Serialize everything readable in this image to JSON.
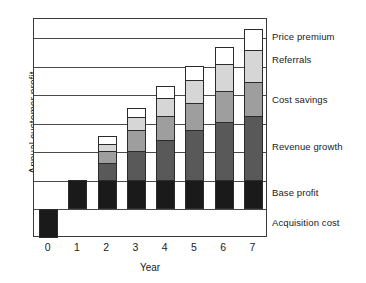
{
  "chart_data": {
    "type": "bar",
    "subtype": "stacked-bar",
    "title": "",
    "xlabel": "Year",
    "ylabel": "Annual customer profit",
    "categories": [
      "0",
      "1",
      "2",
      "3",
      "4",
      "5",
      "6",
      "7"
    ],
    "grid": true,
    "legend_position": "right-inline",
    "ylim": [
      -1.2,
      8.0
    ],
    "yticks_labeled": false,
    "gridline_values": [
      1.2,
      2.4,
      3.6,
      4.8,
      6.0,
      7.2
    ],
    "series": [
      {
        "name": "Acquisition cost",
        "color": "#1a1a1a",
        "sign": "negative",
        "values": [
          -1.2,
          0,
          0,
          0,
          0,
          0,
          0,
          0
        ]
      },
      {
        "name": "Base profit",
        "color": "#1a1a1a",
        "values": [
          0,
          1.2,
          1.2,
          1.2,
          1.2,
          1.2,
          1.2,
          1.2
        ]
      },
      {
        "name": "Revenue growth",
        "color": "#595959",
        "values": [
          0,
          0,
          0.75,
          1.25,
          1.7,
          2.1,
          2.45,
          2.7
        ]
      },
      {
        "name": "Cost savings",
        "color": "#9e9e9e",
        "values": [
          0,
          0,
          0.5,
          0.85,
          1.0,
          1.15,
          1.3,
          1.45
        ]
      },
      {
        "name": "Referrals",
        "color": "#d6d6d6",
        "values": [
          0,
          0,
          0.3,
          0.55,
          0.75,
          0.95,
          1.15,
          1.35
        ]
      },
      {
        "name": "Price premium",
        "color": "#ffffff",
        "values": [
          0,
          0,
          0.3,
          0.4,
          0.5,
          0.6,
          0.7,
          0.85
        ]
      }
    ],
    "totals": [
      -1.2,
      1.2,
      3.05,
      4.25,
      5.15,
      6.0,
      6.8,
      7.55
    ],
    "annotations": [
      {
        "text": "Price premium",
        "y_value": 7.2
      },
      {
        "text": "Referrals",
        "y_value": 6.25
      },
      {
        "text": "Cost savings",
        "y_value": 4.55
      },
      {
        "text": "Revenue growth",
        "y_value": 2.6
      },
      {
        "text": "Base profit",
        "y_value": 0.65
      },
      {
        "text": "Acquisition cost",
        "y_value": -0.6
      }
    ]
  },
  "colors": {
    "base_profit": "#1a1a1a",
    "revenue_growth": "#595959",
    "cost_savings": "#9e9e9e",
    "referrals": "#d6d6d6",
    "price_premium": "#ffffff",
    "acquisition_cost": "#1a1a1a",
    "axis": "#3a3a3a",
    "grid": "#4a4a4a",
    "text": "#1a1a1a"
  }
}
